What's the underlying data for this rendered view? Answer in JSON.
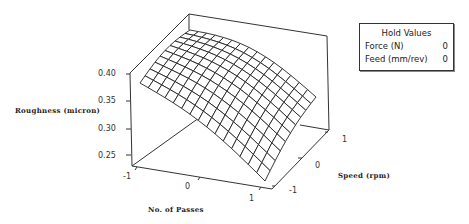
{
  "chart_data": {
    "type": "surface",
    "title": "",
    "xlabel": "No. of Passes",
    "ylabel": "Speed (rpm)",
    "zlabel": "Roughness (micron)",
    "x_ticks": [
      "-1",
      "0",
      "1"
    ],
    "y_ticks": [
      "-1",
      "0",
      "1"
    ],
    "z_ticks": [
      "0.25",
      "0.30",
      "0.35",
      "0.40"
    ],
    "xlim": [
      -1,
      1
    ],
    "ylim": [
      -1,
      1
    ],
    "zlim": [
      0.23,
      0.42
    ],
    "grid_size": [
      16,
      11
    ],
    "surface_corners": {
      "passes_-1_speed_1": 0.41,
      "passes_-1_speed_-1": 0.39,
      "passes_1_speed_1": 0.33,
      "passes_1_speed_-1": 0.25
    },
    "legend": {
      "title": "Hold Values",
      "entries": [
        {
          "name": "Force (N)",
          "value": "0"
        },
        {
          "name": "Feed (mm/rev)",
          "value": "0"
        }
      ]
    }
  },
  "labels": {
    "z_ticks": [
      {
        "text": "0.40",
        "x": 98,
        "y": 69
      },
      {
        "text": "0.35",
        "x": 98,
        "y": 96
      },
      {
        "text": "0.30",
        "x": 98,
        "y": 124
      },
      {
        "text": "0.25",
        "x": 98,
        "y": 151
      }
    ],
    "passes_ticks": [
      {
        "text": "-1",
        "x": 123,
        "y": 172
      },
      {
        "text": "0",
        "x": 185,
        "y": 182
      },
      {
        "text": "1",
        "x": 249,
        "y": 194
      }
    ],
    "speed_ticks": [
      {
        "text": "-1",
        "x": 289,
        "y": 186
      },
      {
        "text": "0",
        "x": 315,
        "y": 161
      },
      {
        "text": "1",
        "x": 342,
        "y": 135
      }
    ],
    "zlabel": "Roughness (micron)",
    "xlabel": "No. of Passes",
    "ylabel": "Speed (rpm)"
  },
  "legend": {
    "title": "Hold Values",
    "rows": [
      {
        "label": "Force (N)",
        "value": "0"
      },
      {
        "label": "Feed (mm/rev)",
        "value": "0"
      }
    ]
  }
}
